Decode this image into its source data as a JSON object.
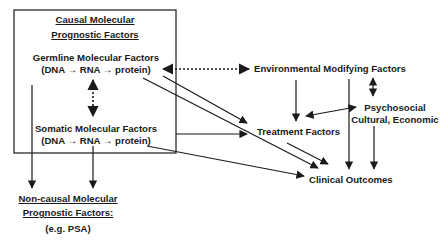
{
  "diagram": {
    "causal_box": {
      "title_line1": "Causal Molecular",
      "title_line2": "Prognostic Factors",
      "germline_line1": "Germline Molecular Factors",
      "germline_line2": "(DNA → RNA → protein)",
      "somatic_line1": "Somatic Molecular Factors",
      "somatic_line2": "(DNA → RNA → protein)"
    },
    "noncausal": {
      "line1": "Non-causal Molecular",
      "line2": "Prognostic Factors:",
      "example": "(e.g. PSA)"
    },
    "environmental": "Environmental Modifying Factors",
    "psychosocial_line1": "Psychosocial",
    "psychosocial_line2": "Cultural, Economic",
    "treatment": "Treatment Factors",
    "outcomes": "Clinical Outcomes",
    "colors": {
      "ink": "#1a1a1a",
      "background": "#ffffff"
    }
  }
}
